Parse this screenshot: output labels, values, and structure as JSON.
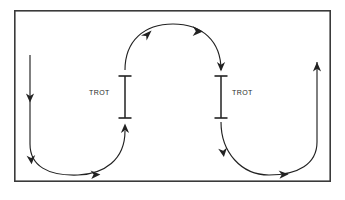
{
  "figure": {
    "name": "serpentine-trot-pattern-diagram",
    "background_color": "#ffffff",
    "ink_color": "#222222"
  },
  "arena": {
    "name": "arena-border",
    "x": 14,
    "y": 10,
    "width": 317,
    "height": 172,
    "stroke_color": "#3a3a3a",
    "stroke_width": 1.6,
    "fill": "#ffffff"
  },
  "markers": [
    {
      "id": "trot-marker-left",
      "label": "TROT",
      "label_side": "left",
      "x": 125,
      "y_top": 76,
      "y_bottom": 118,
      "cap_width": 13
    },
    {
      "id": "trot-marker-right",
      "label": "TROT",
      "label_side": "right",
      "x": 221,
      "y_top": 76,
      "y_bottom": 118,
      "cap_width": 13
    }
  ],
  "path_segments": [
    {
      "id": "entry-straight-left",
      "kind": "line",
      "direction": "down",
      "from_x": 30,
      "from_y": 55,
      "to_x": 30,
      "to_y": 104,
      "arrowheads": 1
    },
    {
      "id": "lower-left-u-turn",
      "kind": "curve",
      "direction": "clockwise",
      "from_x": 30,
      "from_y": 104,
      "to_x": 125,
      "to_y": 122,
      "bottom_y": 174,
      "arrowheads": 2
    },
    {
      "id": "upper-arc-between-markers",
      "kind": "curve",
      "direction": "over-the-top",
      "from_x": 125,
      "from_y": 72,
      "to_x": 221,
      "to_y": 72,
      "peak_y": 24,
      "arrowheads": 2
    },
    {
      "id": "lower-right-u-turn",
      "kind": "curve",
      "direction": "clockwise",
      "from_x": 221,
      "from_y": 122,
      "to_x": 317,
      "to_y": 104,
      "bottom_y": 174,
      "arrowheads": 2
    },
    {
      "id": "exit-straight-right",
      "kind": "line",
      "direction": "up",
      "from_x": 317,
      "from_y": 104,
      "to_x": 317,
      "to_y": 60,
      "arrowheads": 1
    }
  ],
  "legend": {
    "trot_text": "TROT"
  }
}
